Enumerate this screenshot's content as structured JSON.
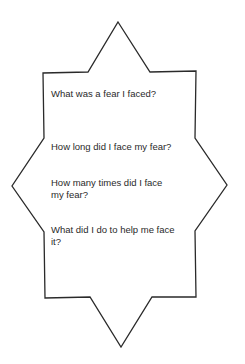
{
  "worksheet": {
    "questions": [
      {
        "text": "What was a fear I faced?"
      },
      {
        "text": "How long did I face my fear?"
      },
      {
        "text": "How many times did I face my fear?"
      },
      {
        "text": "What did I do to help me face it?"
      }
    ],
    "colors": {
      "outline": "#2a2a2a",
      "text": "#2a2a2a",
      "background": "#ffffff"
    }
  }
}
